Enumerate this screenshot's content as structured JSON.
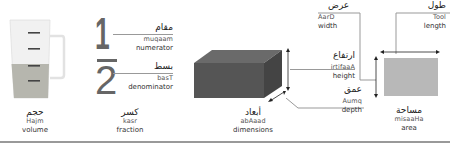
{
  "items": [
    {
      "id": "volume",
      "arabic": "حجم",
      "translit": "Hajm",
      "english": "volume"
    },
    {
      "id": "fraction",
      "arabic": "كسر",
      "translit": "kasr",
      "english": "fraction",
      "numerator_digit": "1",
      "denominator_digit": "2",
      "parts": [
        {
          "arabic": "مقام",
          "translit": "muqaam",
          "english": "numerator"
        },
        {
          "arabic": "بسط",
          "translit": "basT",
          "english": "denominator"
        }
      ]
    },
    {
      "id": "dimensions",
      "arabic": "أبعاد",
      "translit": "abAaad",
      "english": "dimensions",
      "parts": [
        {
          "arabic": "عرض",
          "translit": "AarD",
          "english": "width"
        },
        {
          "arabic": "ارتفاع",
          "translit": "irtifaaA",
          "english": "height"
        },
        {
          "arabic": "عمق",
          "translit": "Aumq",
          "english": "depth"
        }
      ]
    },
    {
      "id": "area",
      "arabic": "مساحة",
      "translit": "misaaHa",
      "english": "area",
      "parts": [
        {
          "arabic": "طول",
          "translit": "Tool",
          "english": "length"
        }
      ]
    }
  ],
  "colors": {
    "box_front": "#555555",
    "box_top": "#6a6a6a",
    "box_side": "#444444",
    "area_fill": "#b8b8b8",
    "liquid": "#b5b5ad",
    "lines": "#999999"
  }
}
